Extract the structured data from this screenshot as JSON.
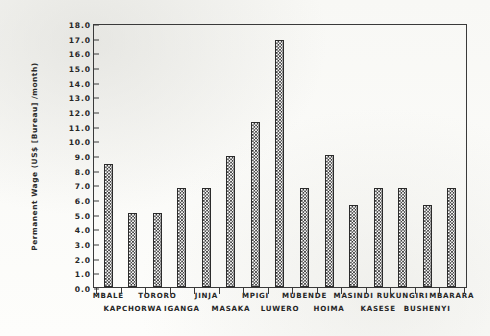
{
  "chart_data": {
    "type": "bar",
    "title": "",
    "subtitle": "",
    "xlabel": "",
    "ylabel": "Permanent Wage (US$ [Bureau] /month)",
    "ylim": [
      0.0,
      18.0
    ],
    "ytick_step": 1.0,
    "grid": false,
    "legend": "none",
    "bar_fill": "checkerboard-hatch",
    "bar_color": "#2e2e2e",
    "axis_color": "#3a3a3a",
    "categories": [
      "MBALE",
      "KAPCHORWA",
      "TORORO",
      "IGANGA",
      "JINJA",
      "MASAKA",
      "MPIGI",
      "LUWERO",
      "MUBENDE",
      "HOIMA",
      "MASINDI",
      "KASESE",
      "RUKUNGIRI",
      "BUSHENYI",
      "MBARARA"
    ],
    "values": [
      8.4,
      5.05,
      5.05,
      6.75,
      6.75,
      8.95,
      11.25,
      16.85,
      6.75,
      9.0,
      5.6,
      6.75,
      6.75,
      5.6,
      6.75
    ],
    "ytick_labels": [
      "0.0",
      "1.0",
      "2.0",
      "3.0",
      "4.0",
      "5.0",
      "6.0",
      "7.0",
      "8.0",
      "9.0",
      "10.0",
      "11.0",
      "12.0",
      "13.0",
      "14.0",
      "15.0",
      "16.0",
      "17.0",
      "18.0"
    ],
    "xtick_label_rows": [
      {
        "row": 0,
        "labels": [
          "MBALE",
          "TORORO",
          "JINJA",
          "MPIGI",
          "MUBENDE",
          "MASINDI",
          "RUKUNGIRI",
          "MBARARA"
        ]
      },
      {
        "row": 1,
        "labels": [
          "KAPCHORWA",
          "IGANGA",
          "MASAKA",
          "LUWERO",
          "HOIMA",
          "KASESE",
          "BUSHENYI"
        ]
      }
    ]
  }
}
